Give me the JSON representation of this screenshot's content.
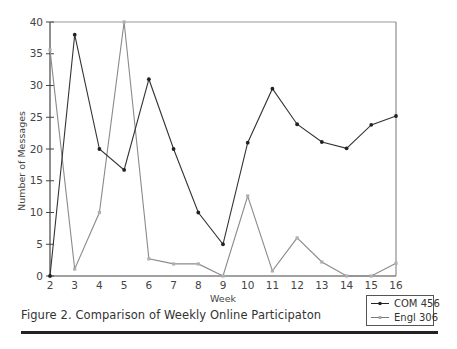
{
  "chart_data": {
    "type": "line",
    "title": "Figure 2. Comparison of Weekly Online Participaton",
    "xlabel": "Week",
    "ylabel": "Number of Messages",
    "x": [
      2,
      3,
      4,
      5,
      6,
      7,
      8,
      9,
      10,
      11,
      12,
      13,
      14,
      15,
      16
    ],
    "xlim": [
      2,
      16
    ],
    "ylim": [
      0,
      40
    ],
    "yticks": [
      0,
      5,
      10,
      15,
      20,
      25,
      30,
      35,
      40
    ],
    "xticks": [
      2,
      3,
      4,
      5,
      6,
      7,
      8,
      9,
      10,
      11,
      12,
      13,
      14,
      15,
      16
    ],
    "grid": false,
    "legend_position": "bottom-right, outside plot",
    "series": [
      {
        "name": "COM 456",
        "color": "#222222",
        "marker": "circle",
        "values": [
          0,
          38,
          20,
          16.7,
          31,
          20,
          10,
          5,
          21,
          29.5,
          23.9,
          21.1,
          20.1,
          23.8,
          25.2
        ]
      },
      {
        "name": "Engl 306",
        "color": "#9a9a9a",
        "marker": "square",
        "values": [
          35.6,
          1.1,
          10,
          40,
          2.7,
          1.9,
          1.9,
          0,
          12.6,
          0.8,
          6,
          2.2,
          0,
          0,
          2
        ]
      }
    ]
  },
  "caption": "Figure 2. Comparison of Weekly Online Participaton",
  "legend": {
    "items": [
      {
        "label": "COM 456"
      },
      {
        "label": "Engl 306"
      }
    ]
  }
}
